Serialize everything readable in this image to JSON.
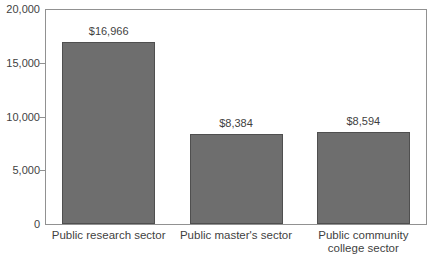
{
  "chart_data": {
    "type": "bar",
    "title": "",
    "xlabel": "",
    "ylabel": "",
    "categories": [
      "Public research sector",
      "Public master's sector",
      "Public community\ncollege sector"
    ],
    "values": [
      16966,
      8384,
      8594
    ],
    "value_labels": [
      "$16,966",
      "$8,384",
      "$8,594"
    ],
    "ylim": [
      0,
      20000
    ],
    "yticks": [
      {
        "value": 0,
        "label": "0"
      },
      {
        "value": 5000,
        "label": "5,000"
      },
      {
        "value": 10000,
        "label": "10,000"
      },
      {
        "value": 15000,
        "label": "15,000"
      },
      {
        "value": 20000,
        "label": "20,000"
      }
    ],
    "grid": false,
    "legend": false,
    "colors": {
      "bar_fill": "#6e6e6e",
      "bar_border": "#4f4f4f",
      "axis_line": "#919191",
      "text": "#3f3f3f",
      "background": "#ffffff"
    }
  }
}
